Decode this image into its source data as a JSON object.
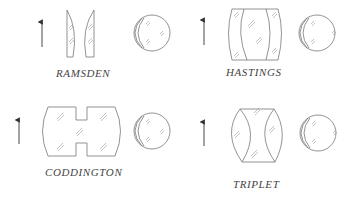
{
  "diagram": {
    "title": "",
    "panels": [
      {
        "id": "ramsden",
        "label": "RAMSDEN",
        "lens_type": "two plano-convex lenses, convex sides facing each other",
        "elements": [
          "object-arrow",
          "lens-pair",
          "eye"
        ]
      },
      {
        "id": "hastings",
        "label": "HASTINGS",
        "lens_type": "cemented triplet (biconvex center, concave outer elements)",
        "elements": [
          "object-arrow",
          "lens-triplet",
          "eye"
        ]
      },
      {
        "id": "coddington",
        "label": "CODDINGTON",
        "lens_type": "single thick lens with grooved waist",
        "elements": [
          "object-arrow",
          "grooved-lens",
          "eye"
        ]
      },
      {
        "id": "triplet",
        "label": "TRIPLET",
        "lens_type": "triplet (biconvex outers, biconcave center)",
        "elements": [
          "object-arrow",
          "lens-triplet",
          "eye"
        ]
      }
    ],
    "colors": {
      "line": "#777777",
      "text": "#444444",
      "background": "#ffffff"
    }
  }
}
